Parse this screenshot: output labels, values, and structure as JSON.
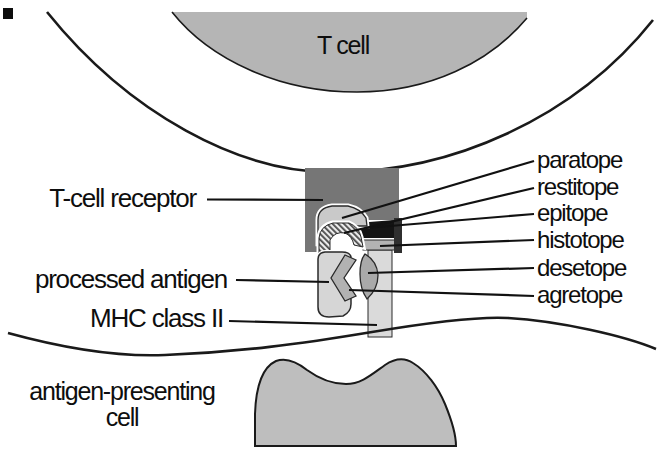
{
  "labels": {
    "t_cell": "T cell",
    "tcr": "T-cell receptor",
    "processed_antigen": "processed antigen",
    "mhc": "MHC class II",
    "apc_line1": "antigen-presenting",
    "apc_line2": "cell",
    "paratope": "paratope",
    "restitope": "restitope",
    "epitope": "epitope",
    "histotope": "histotope",
    "desetope": "desetope",
    "agretope": "agretope"
  },
  "colors": {
    "t_cell_fill": "#b5b5b5",
    "apc_fill": "#bebebe",
    "receptor_fill": "#767676",
    "receptor_edge_fill": "#2f2f2f",
    "paratope_fill": "#c9c9c9",
    "epitope_fill": "#141414",
    "histotope_fill": "#b3b3b3",
    "mhc_column_fill": "#dadada",
    "antigen_fill": "#d6d6d6",
    "agretope_fill": "#b2b2b2",
    "desetope_fill": "#a9a9a9",
    "hatch_stripe": "#4a4a4a",
    "outline": "#1a1a1a"
  }
}
